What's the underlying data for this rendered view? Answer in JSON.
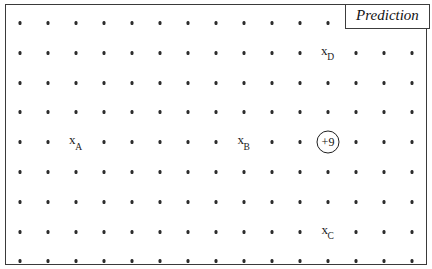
{
  "figure": {
    "caption": "Prediction",
    "frame": {
      "left": 5,
      "top": 4,
      "width": 422,
      "height": 261,
      "border_color": "#3a3a3a"
    }
  },
  "grid": {
    "columns": 15,
    "rows": 9,
    "origin_x": 20,
    "origin_y": 23,
    "step_x": 28,
    "step_y": 29.8,
    "dot_color": "#2c2c2c",
    "occluded_cells": [
      {
        "row": 1,
        "col": 13,
        "reason": "prediction-caption-box"
      },
      {
        "row": 1,
        "col": 14,
        "reason": "prediction-caption-box"
      },
      {
        "row": 1,
        "col": 15,
        "reason": "prediction-caption-box"
      }
    ],
    "label_cells": [
      {
        "row": 5,
        "col": 3
      },
      {
        "row": 5,
        "col": 9
      },
      {
        "row": 2,
        "col": 12
      },
      {
        "row": 8,
        "col": 12
      },
      {
        "row": 5,
        "col": 12
      }
    ]
  },
  "state_labels": [
    {
      "id": "x-a",
      "base": "x",
      "subscript": "A",
      "row": 5,
      "col": 3
    },
    {
      "id": "x-b",
      "base": "x",
      "subscript": "B",
      "row": 5,
      "col": 9
    },
    {
      "id": "x-d",
      "base": "x",
      "subscript": "D",
      "row": 2,
      "col": 12
    },
    {
      "id": "x-c",
      "base": "x",
      "subscript": "C",
      "row": 8,
      "col": 12
    }
  ],
  "reward_marker": {
    "id": "reward-plus-9",
    "value": "+9",
    "row": 5,
    "col": 12,
    "shape": "circle",
    "border_color": "#1f1f1f"
  }
}
